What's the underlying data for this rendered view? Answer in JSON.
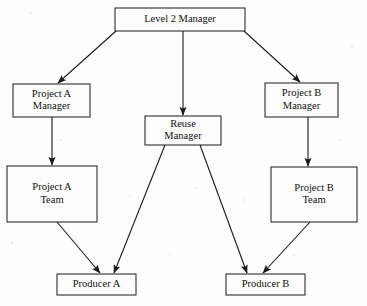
{
  "diagram": {
    "type": "organizational-hierarchy",
    "canvas": {
      "width": 367,
      "height": 306
    },
    "style": {
      "background_color": "#fdfdfd",
      "box_fill": "#fdfdfd",
      "line_color": "#1a1a1a",
      "text_color": "#101010"
    },
    "nodes": [
      {
        "id": "level2-manager",
        "label": "Level 2 Manager",
        "lines": [
          "Level 2 Manager"
        ],
        "x": 115,
        "y": 8,
        "w": 130,
        "h": 23
      },
      {
        "id": "project-a-manager",
        "label": "Project A Manager",
        "lines": [
          "Project A",
          "Manager"
        ],
        "x": 13,
        "y": 84,
        "w": 77,
        "h": 33
      },
      {
        "id": "reuse-manager",
        "label": "Reuse Manager",
        "lines": [
          "Reuse",
          "Manager"
        ],
        "x": 145,
        "y": 116,
        "w": 76,
        "h": 29
      },
      {
        "id": "project-b-manager",
        "label": "Project B Manager",
        "lines": [
          "Project B",
          "Manager"
        ],
        "x": 265,
        "y": 83,
        "w": 73,
        "h": 34
      },
      {
        "id": "project-a-team",
        "label": "Project A Team",
        "lines": [
          "Project A",
          "Team"
        ],
        "x": 7,
        "y": 166,
        "w": 90,
        "h": 56
      },
      {
        "id": "project-b-team",
        "label": "Project B Team",
        "lines": [
          "Project B",
          "Team"
        ],
        "x": 271,
        "y": 167,
        "w": 86,
        "h": 55
      },
      {
        "id": "producer-a",
        "label": "Producer A",
        "lines": [
          "Producer A"
        ],
        "x": 57,
        "y": 274,
        "w": 79,
        "h": 21
      },
      {
        "id": "producer-b",
        "label": "Producer B",
        "lines": [
          "Producer B"
        ],
        "x": 226,
        "y": 274,
        "w": 79,
        "h": 21
      }
    ],
    "edges": [
      {
        "id": "edge-l2m-to-pam",
        "from": "level2-manager",
        "to": "project-a-manager",
        "x1": 116,
        "y1": 31,
        "x2": 58,
        "y2": 83
      },
      {
        "id": "edge-l2m-to-reuse",
        "from": "level2-manager",
        "to": "reuse-manager",
        "x1": 183,
        "y1": 31,
        "x2": 183,
        "y2": 115
      },
      {
        "id": "edge-l2m-to-pbm",
        "from": "level2-manager",
        "to": "project-b-manager",
        "x1": 244,
        "y1": 31,
        "x2": 300,
        "y2": 82
      },
      {
        "id": "edge-pam-to-pat",
        "from": "project-a-manager",
        "to": "project-a-team",
        "x1": 52,
        "y1": 117,
        "x2": 52,
        "y2": 165
      },
      {
        "id": "edge-pbm-to-pbt",
        "from": "project-b-manager",
        "to": "project-b-team",
        "x1": 308,
        "y1": 117,
        "x2": 308,
        "y2": 166
      },
      {
        "id": "edge-pat-to-proda",
        "from": "project-a-team",
        "to": "producer-a",
        "x1": 57,
        "y1": 222,
        "x2": 100,
        "y2": 273
      },
      {
        "id": "edge-reuse-to-proda",
        "from": "reuse-manager",
        "to": "producer-a",
        "x1": 165,
        "y1": 145,
        "x2": 114,
        "y2": 273
      },
      {
        "id": "edge-reuse-to-prodb",
        "from": "reuse-manager",
        "to": "producer-b",
        "x1": 200,
        "y1": 145,
        "x2": 247,
        "y2": 273
      },
      {
        "id": "edge-pbt-to-prodb",
        "from": "project-b-team",
        "to": "producer-b",
        "x1": 310,
        "y1": 222,
        "x2": 263,
        "y2": 273
      }
    ]
  }
}
